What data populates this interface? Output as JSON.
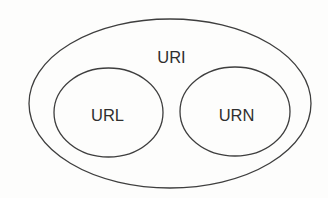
{
  "diagram": {
    "type": "venn-containment",
    "background": "#fdfdfc",
    "stroke_color": "#3e3e3e",
    "text_color": "#2f2f2f",
    "nodes": [
      {
        "id": "uri",
        "label": "URI",
        "shape": "ellipse",
        "cx": 170,
        "cy": 103.5,
        "rx": 141,
        "ry": 84.5,
        "label_x": 171.5,
        "label_y": 63,
        "contains": [
          "url",
          "urn"
        ]
      },
      {
        "id": "url",
        "label": "URL",
        "shape": "ellipse",
        "cx": 108.5,
        "cy": 112.5,
        "rx": 54.5,
        "ry": 44.5,
        "label_x": 107.5,
        "label_y": 121
      },
      {
        "id": "urn",
        "label": "URN",
        "shape": "ellipse",
        "cx": 235,
        "cy": 111.5,
        "rx": 55,
        "ry": 44.5,
        "label_x": 236.5,
        "label_y": 121
      }
    ]
  }
}
